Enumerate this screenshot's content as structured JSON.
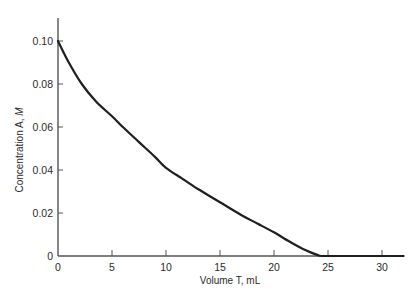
{
  "chart_data": {
    "type": "line",
    "title": "",
    "xlabel": "Volume T, mL",
    "ylabel_main": "Concentration A, ",
    "ylabel_unit": "M",
    "xlim": [
      0,
      32
    ],
    "ylim": [
      0,
      0.11
    ],
    "grid": false,
    "legend": null,
    "x_ticks": [
      0,
      5,
      10,
      15,
      20,
      25,
      30
    ],
    "x_tick_labels": [
      "0",
      "5",
      "10",
      "15",
      "20",
      "25",
      "30"
    ],
    "y_ticks": [
      0,
      0.02,
      0.04,
      0.06,
      0.08,
      0.1
    ],
    "y_tick_labels": [
      "0",
      "0.02",
      "0.04",
      "0.06",
      "0.08",
      "0.10"
    ],
    "series": [
      {
        "name": "Concentration A",
        "color": "#1e1e1e",
        "x": [
          0,
          1,
          2.2,
          3.5,
          5,
          6,
          7.5,
          9,
          10,
          11.5,
          13,
          15,
          17,
          18.5,
          20,
          21.5,
          23,
          24,
          24.4,
          26,
          28,
          30,
          32
        ],
        "y": [
          0.1,
          0.09,
          0.08,
          0.072,
          0.065,
          0.06,
          0.053,
          0.046,
          0.041,
          0.036,
          0.031,
          0.025,
          0.019,
          0.015,
          0.011,
          0.0065,
          0.0025,
          0.0005,
          0.0,
          0.0,
          0.0,
          0.0,
          0.0
        ]
      }
    ]
  }
}
